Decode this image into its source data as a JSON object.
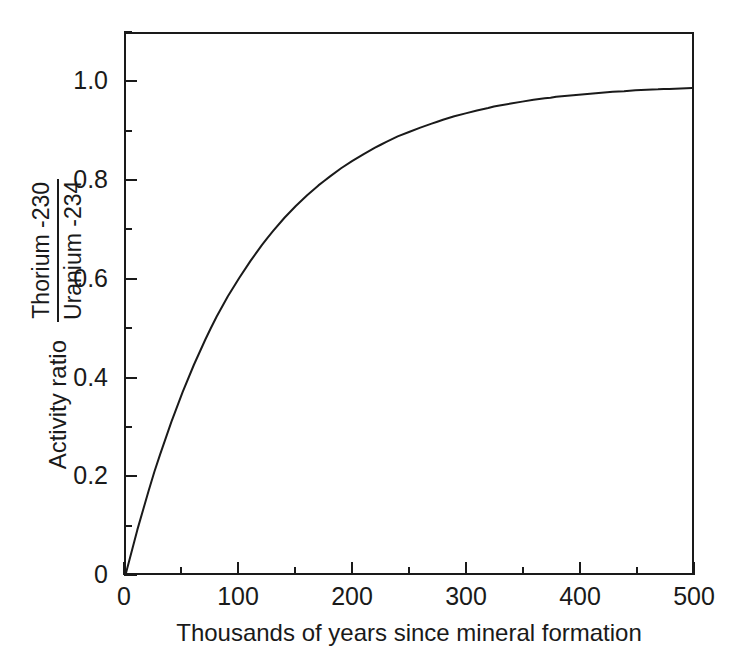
{
  "chart_data": {
    "type": "line",
    "title": "",
    "xlabel": "Thousands of years since mineral formation",
    "ylabel": "Activity ratio",
    "ylabel_fraction_numerator": "Thorium -230",
    "ylabel_fraction_denominator": "Uranium -234",
    "xlim": [
      0,
      500
    ],
    "ylim": [
      0,
      1.1
    ],
    "grid": false,
    "legend": "none",
    "line_color": "#1a1a1a",
    "background_color": "#ffffff",
    "x_ticks": [
      0,
      100,
      200,
      300,
      400,
      500
    ],
    "x_tick_labels": [
      "0",
      "100",
      "200",
      "300",
      "400",
      "500"
    ],
    "x_minor_ticks": [
      50,
      150,
      250,
      350,
      450
    ],
    "y_ticks": [
      0,
      0.2,
      0.4,
      0.6,
      0.8,
      1.0
    ],
    "y_tick_labels": [
      "0",
      "0.2",
      "0.4",
      "0.6",
      "0.8",
      "1.0"
    ],
    "y_minor_ticks": [
      0.1,
      0.3,
      0.5,
      0.7,
      0.9,
      1.1
    ],
    "series": [
      {
        "name": "Th-230 / U-234 activity ratio",
        "model": "1 - exp(-lambda * t)",
        "x": [
          0,
          10,
          20,
          25,
          30,
          40,
          50,
          60,
          70,
          75,
          80,
          90,
          100,
          110,
          120,
          125,
          130,
          140,
          150,
          160,
          170,
          175,
          180,
          190,
          200,
          210,
          220,
          225,
          230,
          240,
          250,
          260,
          270,
          275,
          280,
          290,
          300,
          310,
          320,
          325,
          330,
          340,
          350,
          360,
          370,
          375,
          380,
          390,
          400,
          410,
          420,
          425,
          430,
          440,
          450,
          460,
          470,
          475,
          480,
          490,
          500
        ],
        "y": [
          0,
          0.088,
          0.168,
          0.206,
          0.241,
          0.308,
          0.369,
          0.425,
          0.476,
          0.5,
          0.523,
          0.565,
          0.602,
          0.637,
          0.669,
          0.684,
          0.698,
          0.725,
          0.749,
          0.771,
          0.791,
          0.8,
          0.809,
          0.826,
          0.841,
          0.855,
          0.868,
          0.874,
          0.88,
          0.891,
          0.9,
          0.909,
          0.917,
          0.921,
          0.925,
          0.932,
          0.938,
          0.944,
          0.949,
          0.952,
          0.954,
          0.958,
          0.962,
          0.966,
          0.969,
          0.97,
          0.972,
          0.974,
          0.976,
          0.978,
          0.98,
          0.981,
          0.982,
          0.983,
          0.985,
          0.986,
          0.987,
          0.988,
          0.988,
          0.989,
          0.99
        ]
      }
    ]
  },
  "axes": {
    "x_title": "Thousands of years since mineral formation",
    "y_title": "Activity ratio",
    "y_fraction_numerator": "Thorium -230",
    "y_fraction_denominator": "Uranium -234"
  }
}
